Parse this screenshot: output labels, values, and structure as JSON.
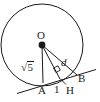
{
  "figure": {
    "type": "geometry-diagram",
    "background_color": "#ffffff",
    "stroke_color": "#1a1a1a",
    "width": 100,
    "height": 102,
    "circle": {
      "center_label": "O",
      "center_x": 42,
      "center_y": 45,
      "radius": 41
    },
    "points": [
      {
        "id": "O",
        "label": "O",
        "x": 42,
        "y": 45,
        "marker": "filled-dot"
      },
      {
        "id": "A",
        "label": "A",
        "x": 43,
        "y": 83,
        "marker": "none"
      },
      {
        "id": "B",
        "label": "B",
        "x": 77,
        "y": 75,
        "marker": "none"
      },
      {
        "id": "H",
        "label": "H",
        "x": 60,
        "y": 79,
        "marker": "none"
      }
    ],
    "segments": [
      {
        "id": "OA",
        "from": "O",
        "to": "A",
        "label": "√5"
      },
      {
        "id": "OH",
        "from": "O",
        "to": "H",
        "label": "d"
      },
      {
        "id": "OB",
        "from": "O",
        "to": "B",
        "label": ""
      },
      {
        "id": "AH",
        "from": "A",
        "to": "H",
        "label": "1"
      }
    ],
    "labels": {
      "center": "O",
      "point_a": "A",
      "point_b": "B",
      "foot_h": "H",
      "distance": "d",
      "half_chord": "1",
      "radius_value": "5",
      "radius_radical": "√"
    },
    "right_angle": {
      "at": "H",
      "marker": "square",
      "size": 7
    },
    "secant_line": {
      "from_x": 17,
      "from_y": 93,
      "to_x": 96,
      "to_y": 70
    }
  }
}
